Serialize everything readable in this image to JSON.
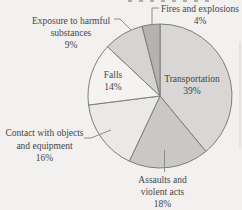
{
  "chart_data": {
    "type": "pie",
    "title": "",
    "direction": "clockwise",
    "start_angle_deg": 0,
    "stroke_color": "#7d7d7d",
    "categories": [
      "Transportation",
      "Assaults and violent acts",
      "Contact with objects and equipment",
      "Falls",
      "Exposure to harmful substances",
      "Fires and explosions"
    ],
    "values": [
      39,
      18,
      16,
      14,
      9,
      4
    ],
    "slices": [
      {
        "label": "Transportation",
        "pct_label": "39%",
        "value": 39,
        "color": "#d8d7d5"
      },
      {
        "label": "Assaults and violent acts",
        "pct_label": "18%",
        "value": 18,
        "color": "#c9c8c6"
      },
      {
        "label": "Contact with objects and equipment",
        "pct_label": "16%",
        "value": 16,
        "color": "#eae9e7"
      },
      {
        "label": "Falls",
        "pct_label": "14%",
        "value": 14,
        "color": "#f4f3f1"
      },
      {
        "label": "Exposure to harmful substances",
        "pct_label": "9%",
        "value": 9,
        "color": "#d5d4d2"
      },
      {
        "label": "Fires and explosions",
        "pct_label": "4%",
        "value": 4,
        "color": "#b4b3b1"
      }
    ]
  },
  "labels": {
    "fires": {
      "line1": "Fires and explosions",
      "pct": "4%"
    },
    "exposure": {
      "line1": "Exposure to harmful",
      "line2": "substances",
      "pct": "9%"
    },
    "falls": {
      "line1": "Falls",
      "pct": "14%"
    },
    "transportation": {
      "line1": "Transportation",
      "pct": "39%"
    },
    "contact": {
      "line1": "Contact with objects",
      "line2": "and equipment",
      "pct": "16%"
    },
    "assaults": {
      "line1": "Assaults and",
      "line2": "violent acts",
      "pct": "18%"
    }
  }
}
